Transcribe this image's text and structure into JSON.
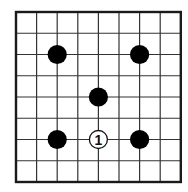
{
  "board": {
    "type": "go-diagram",
    "columns": 9,
    "rows": 9,
    "origin_x": 16,
    "origin_y": 12,
    "cell_w": 20.6,
    "cell_h": 21.25,
    "line_color": "#333333",
    "border_color": "#1a1a1a",
    "background": "#ffffff"
  },
  "stones": [
    {
      "color": "black",
      "col": 2,
      "row": 2,
      "label": ""
    },
    {
      "color": "black",
      "col": 6,
      "row": 2,
      "label": ""
    },
    {
      "color": "black",
      "col": 4,
      "row": 4,
      "label": ""
    },
    {
      "color": "black",
      "col": 2,
      "row": 6,
      "label": ""
    },
    {
      "color": "white",
      "col": 4,
      "row": 6,
      "label": "1"
    },
    {
      "color": "black",
      "col": 6,
      "row": 6,
      "label": ""
    }
  ],
  "colors": {
    "black_stone": "#000000",
    "white_stone_fill": "#ffffff",
    "white_stone_stroke": "#111111",
    "label": "#111111"
  }
}
